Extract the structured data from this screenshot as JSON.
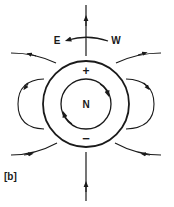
{
  "figure": {
    "label": "[b]",
    "center_label": "N",
    "top_charge": "+",
    "bottom_charge": "−",
    "direction_left": "E",
    "direction_right": "W"
  },
  "colors": {
    "ink": "#1a1a1a",
    "background": "#ffffff"
  },
  "icons": {
    "rotation_arrow": "curved-arrow-west-to-east",
    "inner_circulation": "clockwise-circle-arrow",
    "field_lines": "field-line-arrows"
  }
}
